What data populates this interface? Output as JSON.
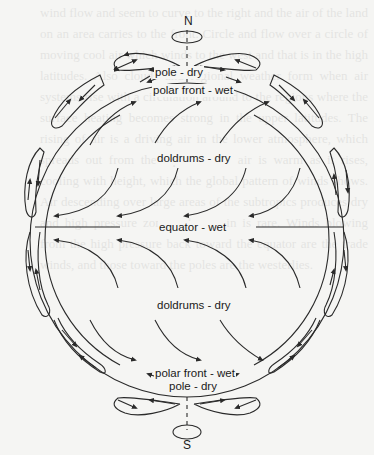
{
  "figure": {
    "type": "global atmospheric circulation diagram",
    "labels": {
      "north": "N",
      "south": "S",
      "north_pole": "pole - dry",
      "north_polar_front": "polar front - wet",
      "north_doldrums": "doldrums - dry",
      "equator": "equator - wet",
      "south_doldrums": "doldrums - dry",
      "south_polar_front": "polar front - wet",
      "south_pole": "pole - dry"
    },
    "colors": {
      "line": "#2a2a2a",
      "background": "#f5f5f3"
    }
  },
  "background_text": "wind flow and seem to curve to the right and the air of the land on an area carries to the front. Circle and flow over a circle of moving cool air which winds to the west and that is in the high latitudes. Also clouds and regional weather form when air systems rise with a circulation around to the regions where the surface heating becomes strong in the upper latitudes. The rising of air is a driving air in the lower atmosphere, which spreads out from the equator. The air is warm as it rises, cooling with height, which the global pattern of winds shows. Air descending over large areas of the subtropics produces dry and high pressure zones where rain is rare. Winds blowing from the high pressure back toward the equator are the trade winds, and those toward the poles are the westerlies."
}
